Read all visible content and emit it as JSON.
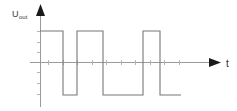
{
  "figure": {
    "kind": "waveform-diagram",
    "background_color": "#ffffff",
    "y_axis": {
      "label": "U",
      "label_subscript": "out",
      "arrow": "up-arrow-icon",
      "axis_color": "#9a9a9a"
    },
    "x_axis": {
      "label": "t",
      "arrow": "right-arrow-icon",
      "axis_color": "#9a9a9a"
    }
  },
  "chart_data": {
    "type": "line",
    "title": "",
    "subtitle": "",
    "xlabel": "t",
    "ylabel": "Uout",
    "grid": false,
    "legend": null,
    "annotations": [],
    "axis_origin_px": {
      "x": 40,
      "y": 62
    },
    "levels": {
      "high_label": "+U",
      "low_label": "-U",
      "zero_label": "0",
      "high_px_y": 31,
      "zero_px_y": 62,
      "low_px_y": 95
    },
    "xlim": [
      40,
      220
    ],
    "ylim": [
      -1,
      1
    ],
    "x": [
      40,
      63,
      63,
      77,
      77,
      103,
      103,
      143,
      143,
      160,
      160,
      181
    ],
    "values": [
      1,
      1,
      -1,
      -1,
      1,
      1,
      -1,
      -1,
      1,
      1,
      -1,
      -1
    ],
    "segments": [
      {
        "level": "high",
        "x_start": 40,
        "x_end": 63
      },
      {
        "level": "low",
        "x_start": 63,
        "x_end": 77
      },
      {
        "level": "high",
        "x_start": 77,
        "x_end": 103
      },
      {
        "level": "low",
        "x_start": 103,
        "x_end": 143
      },
      {
        "level": "high",
        "x_start": 143,
        "x_end": 160
      },
      {
        "level": "low",
        "x_start": 160,
        "x_end": 181
      }
    ],
    "x_axis_ticks_px": [
      48,
      63,
      77,
      92,
      106,
      121,
      135,
      150,
      164,
      179
    ],
    "y_axis_ticks_px": [
      31,
      42,
      52,
      72,
      83,
      94
    ],
    "series_color": "#777777"
  }
}
